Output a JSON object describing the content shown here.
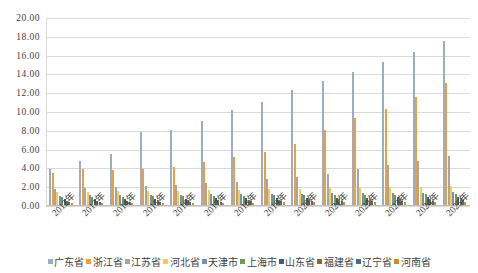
{
  "chart_data": {
    "type": "bar",
    "title": "",
    "subtitle": "",
    "xlabel": "",
    "ylabel": "",
    "ylim": [
      0,
      20
    ],
    "ytick_step": 2,
    "yticks": [
      "0.00",
      "2.00",
      "4.00",
      "6.00",
      "8.00",
      "10.00",
      "12.00",
      "14.00",
      "16.00",
      "18.00",
      "20.00"
    ],
    "grid": true,
    "legend_position": "bottom",
    "categories": [
      "2012年",
      "2013年",
      "2014年",
      "2015年",
      "2016年",
      "2017年",
      "2018年",
      "2019年",
      "2020年",
      "2021年",
      "2022年",
      "2023年",
      "2024年",
      "2025年"
    ],
    "series": [
      {
        "name": "广东省",
        "color": "#9BADC6",
        "values": [
          3.95,
          4.8,
          5.55,
          7.85,
          8.1,
          9.05,
          10.2,
          11.1,
          12.35,
          13.3,
          14.25,
          15.35,
          16.4,
          17.55
        ]
      },
      {
        "name": "浙江省",
        "color": "#ED9E3F",
        "values": [
          3.55,
          3.95,
          3.85,
          3.9,
          4.2,
          4.65,
          5.2,
          5.75,
          6.55,
          8.1,
          9.35,
          10.35,
          11.65,
          13.05
        ]
      },
      {
        "name": "江苏省",
        "color": "#A5A5A5",
        "values": [
          1.85,
          1.95,
          2.05,
          2.15,
          2.25,
          2.4,
          2.6,
          2.85,
          3.1,
          3.45,
          3.9,
          4.35,
          4.8,
          5.35
        ]
      },
      {
        "name": "河北省",
        "color": "#FFC94D",
        "values": [
          1.45,
          1.5,
          1.55,
          1.6,
          1.65,
          1.7,
          1.75,
          1.8,
          1.85,
          1.9,
          1.95,
          2.0,
          2.05,
          2.1
        ]
      },
      {
        "name": "天津市",
        "color": "#7B8FB5",
        "values": [
          1.1,
          1.15,
          1.18,
          1.2,
          1.22,
          1.25,
          1.28,
          1.3,
          1.32,
          1.35,
          1.38,
          1.4,
          1.42,
          1.45
        ]
      },
      {
        "name": "上海市",
        "color": "#6E9B52",
        "values": [
          0.95,
          0.98,
          1.0,
          1.02,
          1.05,
          1.08,
          1.1,
          1.12,
          1.15,
          1.18,
          1.2,
          1.22,
          1.25,
          1.28
        ]
      },
      {
        "name": "山东省",
        "color": "#3F5C7E",
        "values": [
          0.7,
          0.72,
          0.74,
          0.76,
          0.78,
          0.8,
          0.82,
          0.84,
          0.86,
          0.88,
          0.9,
          0.92,
          0.94,
          0.96
        ]
      },
      {
        "name": "福建省",
        "color": "#8A6A2E",
        "values": [
          0.55,
          0.57,
          0.58,
          0.6,
          0.62,
          0.64,
          0.66,
          0.68,
          0.7,
          0.72,
          0.74,
          0.76,
          0.78,
          0.8
        ]
      },
      {
        "name": "辽宁省",
        "color": "#4E6A8C",
        "values": [
          0.4,
          0.42,
          0.43,
          0.45,
          0.46,
          0.48,
          0.49,
          0.51,
          0.52,
          0.54,
          0.55,
          0.57,
          0.58,
          0.6
        ]
      },
      {
        "name": "河南省",
        "color": "#C8922B",
        "values": [
          0.28,
          0.3,
          0.31,
          0.33,
          0.34,
          0.36,
          0.37,
          0.39,
          0.4,
          0.42,
          0.43,
          0.45,
          0.46,
          0.48
        ]
      }
    ]
  }
}
